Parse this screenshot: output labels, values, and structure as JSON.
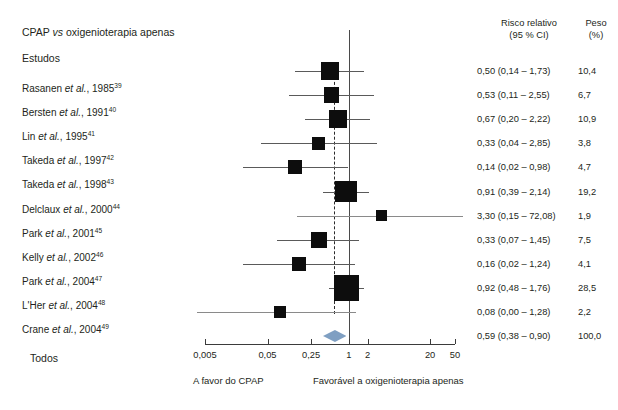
{
  "plot": {
    "title_main": "CPAP",
    "title_italic": "vs",
    "title_rest": "oxigenioterapia apenas",
    "studies_header": "Estudos",
    "total_label": "Todos",
    "rr_header_line1": "Risco relativo",
    "rr_header_line2": "(95 % CI)",
    "weight_header_line1": "Peso",
    "weight_header_line2": "(%)",
    "footer_left": "A favor do CPAP",
    "footer_right": "Favorável a oxigenioterapia apenas",
    "diamond_color": "#7f9fc2",
    "marker_color": "#0d0d0d",
    "line_color": "#5a5a5a",
    "axis_color": "#3b3b3b"
  },
  "axis": {
    "ticks": [
      "0,005",
      "0,05",
      "0,25",
      "1",
      "2",
      "20",
      "50"
    ],
    "tick_values": [
      0.005,
      0.05,
      0.25,
      1,
      2,
      20,
      50
    ],
    "scale": "log",
    "null_value": 1
  },
  "chart_data": {
    "type": "forest",
    "title": "CPAP vs oxigenioterapia apenas",
    "xlabel": "Risco relativo (95 % CI)",
    "ylabel": "Estudos",
    "xscale": "log",
    "xlim": [
      0.005,
      50
    ],
    "xticks": [
      0.005,
      0.05,
      0.25,
      1,
      2,
      20,
      50
    ],
    "xticklabels": [
      "0,005",
      "0,05",
      "0,25",
      "1",
      "2",
      "20",
      "50"
    ],
    "null_line": 1,
    "pooled_line": 0.59,
    "grid": false,
    "legend": "none",
    "annotations": [
      "A favor do CPAP",
      "Favorável a oxigenioterapia apenas"
    ],
    "studies": [
      {
        "label_name": "Rasanen",
        "label_etal": "et al.",
        "label_year": "1985",
        "ref": "39",
        "rr": 0.5,
        "lo": 0.14,
        "hi": 1.73,
        "weight": 10.4,
        "rr_text": "0,50 (0,14 – 1,73)",
        "weight_text": "10,4"
      },
      {
        "label_name": "Bersten",
        "label_etal": "et al.",
        "label_year": "1991",
        "ref": "40",
        "rr": 0.53,
        "lo": 0.11,
        "hi": 2.55,
        "weight": 6.7,
        "rr_text": "0,53 (0,11 – 2,55)",
        "weight_text": "6,7"
      },
      {
        "label_name": "Lin",
        "label_etal": "et al.",
        "label_year": "1995",
        "ref": "41",
        "rr": 0.67,
        "lo": 0.2,
        "hi": 2.22,
        "weight": 10.9,
        "rr_text": "0,67 (0,20 – 2,22)",
        "weight_text": "10,9"
      },
      {
        "label_name": "Takeda",
        "label_etal": "et al.",
        "label_year": "1997",
        "ref": "42",
        "rr": 0.33,
        "lo": 0.04,
        "hi": 2.85,
        "weight": 3.8,
        "rr_text": "0,33 (0,04 – 2,85)",
        "weight_text": "3,8"
      },
      {
        "label_name": "Takeda",
        "label_etal": "et al.",
        "label_year": "1998",
        "ref": "43",
        "rr": 0.14,
        "lo": 0.02,
        "hi": 0.98,
        "weight": 4.7,
        "rr_text": "0,14 (0,02 – 0,98)",
        "weight_text": "4,7"
      },
      {
        "label_name": "Delclaux",
        "label_etal": "et al.",
        "label_year": "2000",
        "ref": "44",
        "rr": 0.91,
        "lo": 0.39,
        "hi": 2.14,
        "weight": 19.2,
        "rr_text": "0,91 (0,39 – 2,14)",
        "weight_text": "19,2"
      },
      {
        "label_name": "Park",
        "label_etal": "et al.",
        "label_year": "2001",
        "ref": "45",
        "rr": 3.3,
        "lo": 0.15,
        "hi": 72.08,
        "weight": 1.9,
        "rr_text": "3,30 (0,15 – 72,08)",
        "weight_text": "1,9"
      },
      {
        "label_name": "Kelly",
        "label_etal": "et al.",
        "label_year": "2002",
        "ref": "46",
        "rr": 0.33,
        "lo": 0.07,
        "hi": 1.45,
        "weight": 7.5,
        "rr_text": "0,33 (0,07 – 1,45)",
        "weight_text": "7,5"
      },
      {
        "label_name": "Park",
        "label_etal": "et al.",
        "label_year": "2004",
        "ref": "47",
        "rr": 0.16,
        "lo": 0.02,
        "hi": 1.24,
        "weight": 4.1,
        "rr_text": "0,16 (0,02 – 1,24)",
        "weight_text": "4,1"
      },
      {
        "label_name": "L'Her",
        "label_etal": "et al.",
        "label_year": "2004",
        "ref": "48",
        "rr": 0.92,
        "lo": 0.48,
        "hi": 1.76,
        "weight": 28.5,
        "rr_text": "0,92 (0,48 – 1,76)",
        "weight_text": "28,5"
      },
      {
        "label_name": "Crane",
        "label_etal": "et al.",
        "label_year": "2004",
        "ref": "49",
        "rr": 0.08,
        "lo": 0.0,
        "hi": 1.28,
        "weight": 2.2,
        "rr_text": "0,08 (0,00 – 1,28)",
        "weight_text": "2,2"
      }
    ],
    "pooled": {
      "label": "Todos",
      "rr": 0.59,
      "lo": 0.38,
      "hi": 0.9,
      "weight": 100.0,
      "rr_text": "0,59 (0,38 – 0,90)",
      "weight_text": "100,0"
    }
  }
}
